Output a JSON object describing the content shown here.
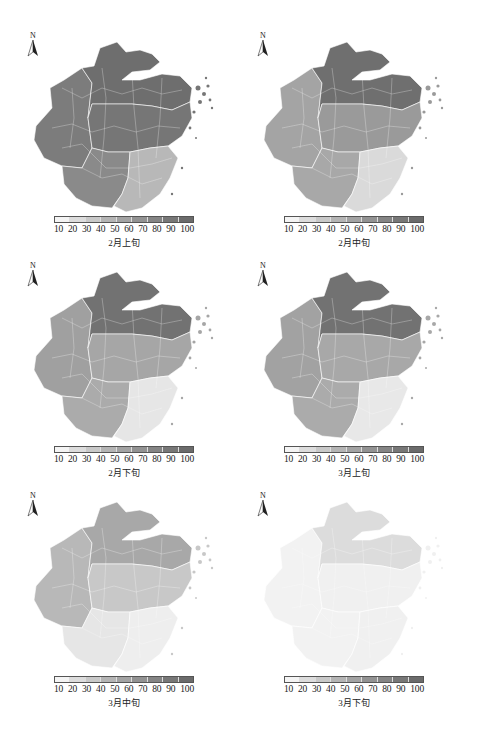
{
  "figure": {
    "north_label": "N",
    "legend": {
      "ticks": [
        "10",
        "20",
        "30",
        "40",
        "50",
        "60",
        "70",
        "80",
        "90",
        "100"
      ],
      "colors": [
        "#f4f4f4",
        "#dcdcdc",
        "#c8c8c8",
        "#b4b4b4",
        "#a2a2a2",
        "#929292",
        "#848484",
        "#777777",
        "#6b6b6b"
      ]
    },
    "panels": [
      {
        "caption": "2月上旬",
        "level_north": "#6e6e6e",
        "level_central": "#767676",
        "level_west": "#7c7c7c",
        "level_south": "#8a8a8a",
        "level_southeast": "#b8b8b8"
      },
      {
        "caption": "2月中旬",
        "level_north": "#6f6f6f",
        "level_central": "#9a9a9a",
        "level_west": "#a4a4a4",
        "level_south": "#a8a8a8",
        "level_southeast": "#dadada"
      },
      {
        "caption": "2月下旬",
        "level_north": "#727272",
        "level_central": "#a6a6a6",
        "level_west": "#a0a0a0",
        "level_south": "#ababab",
        "level_southeast": "#e6e6e6"
      },
      {
        "caption": "3月上旬",
        "level_north": "#727272",
        "level_central": "#a8a8a8",
        "level_west": "#a2a2a2",
        "level_south": "#ababab",
        "level_southeast": "#e8e8e8"
      },
      {
        "caption": "3月中旬",
        "level_north": "#a8a8a8",
        "level_central": "#c8c8c8",
        "level_west": "#b8b8b8",
        "level_south": "#e6e6e6",
        "level_southeast": "#eeeeee"
      },
      {
        "caption": "3月下旬",
        "level_north": "#dcdcdc",
        "level_central": "#f0f0f0",
        "level_west": "#f2f2f2",
        "level_south": "#f2f2f2",
        "level_southeast": "#f0f0f0"
      }
    ]
  }
}
